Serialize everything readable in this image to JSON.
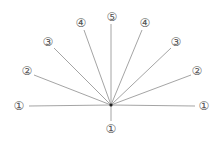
{
  "diagram": {
    "center": {
      "x": 111,
      "y": 105
    },
    "rays": [
      {
        "id": "left-1",
        "label": "①",
        "end": {
          "x": 29,
          "y": 106
        },
        "label_pos": {
          "x": 19,
          "y": 106
        }
      },
      {
        "id": "left-2",
        "label": "②",
        "end": {
          "x": 34,
          "y": 75
        },
        "label_pos": {
          "x": 27,
          "y": 71
        }
      },
      {
        "id": "left-3",
        "label": "③",
        "end": {
          "x": 54,
          "y": 48
        },
        "label_pos": {
          "x": 48,
          "y": 42
        }
      },
      {
        "id": "left-4",
        "label": "④",
        "end": {
          "x": 84,
          "y": 30
        },
        "label_pos": {
          "x": 81,
          "y": 23
        }
      },
      {
        "id": "top-5",
        "label": "⑤",
        "end": {
          "x": 111,
          "y": 24
        },
        "label_pos": {
          "x": 112,
          "y": 17
        }
      },
      {
        "id": "right-4",
        "label": "④",
        "end": {
          "x": 142,
          "y": 30
        },
        "label_pos": {
          "x": 145,
          "y": 23
        }
      },
      {
        "id": "right-3",
        "label": "③",
        "end": {
          "x": 171,
          "y": 48
        },
        "label_pos": {
          "x": 176,
          "y": 42
        }
      },
      {
        "id": "right-2",
        "label": "②",
        "end": {
          "x": 191,
          "y": 75
        },
        "label_pos": {
          "x": 197,
          "y": 71
        }
      },
      {
        "id": "right-1",
        "label": "①",
        "end": {
          "x": 195,
          "y": 106
        },
        "label_pos": {
          "x": 204,
          "y": 106
        }
      },
      {
        "id": "bottom-1",
        "label": "①",
        "end": {
          "x": 111,
          "y": 121
        },
        "label_pos": {
          "x": 111,
          "y": 129
        }
      }
    ],
    "colors": {
      "line": "#9a9a9a",
      "label": "#555555",
      "center": "#222222"
    }
  }
}
